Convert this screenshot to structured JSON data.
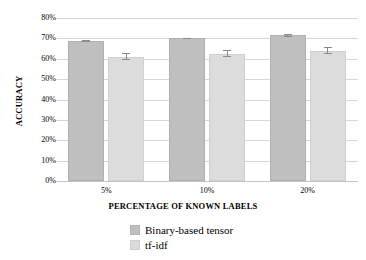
{
  "chart_data": {
    "type": "bar",
    "title": "",
    "xlabel": "PERCENTAGE OF KNOWN LABELS",
    "ylabel": "ACCURACY",
    "categories": [
      "5%",
      "10%",
      "20%"
    ],
    "ytick_labels": [
      "0%",
      "10%",
      "20%",
      "30%",
      "40%",
      "50%",
      "60%",
      "70%",
      "80%"
    ],
    "ytick_values": [
      0,
      10,
      20,
      30,
      40,
      50,
      60,
      70,
      80
    ],
    "ylim": [
      0,
      80
    ],
    "grid": true,
    "legend_position": "bottom",
    "series": [
      {
        "name": "Binary-based tensor",
        "color": "#bfbfbf",
        "values": [
          68.7,
          70.0,
          71.5
        ],
        "errors": [
          0.4,
          0.4,
          0.6
        ]
      },
      {
        "name": "tf-idf",
        "color": "#dcdcdc",
        "values": [
          61.0,
          62.5,
          64.0
        ],
        "errors": [
          1.6,
          1.6,
          1.8
        ]
      }
    ]
  }
}
